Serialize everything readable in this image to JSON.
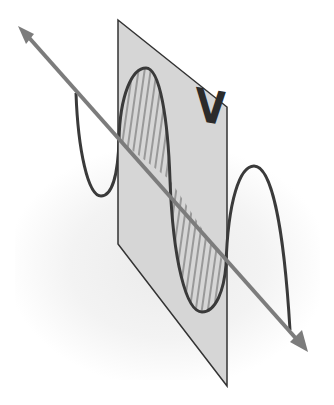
{
  "diagram": {
    "plane_label": "V",
    "colors": {
      "background": "#ffffff",
      "plane_fill": "#d6d6d6",
      "plane_stroke": "#333333",
      "wave_stroke": "#3a3a3a",
      "hatch_stroke": "#707070",
      "axis_arrow": "#7c7c7c",
      "label": "#2b2b2b"
    },
    "elements": [
      {
        "name": "propagation-axis-arrow",
        "type": "double-headed arrow",
        "from": [
          20,
          28
        ],
        "to": [
          306,
          350
        ]
      },
      {
        "name": "polarization-plane",
        "type": "parallelogram",
        "points": [
          [
            118,
            20
          ],
          [
            227,
            107
          ],
          [
            227,
            386
          ],
          [
            118,
            244
          ]
        ]
      },
      {
        "name": "sine-wave",
        "type": "sinusoid",
        "segments": [
          "left lobe (behind plane)",
          "positive lobe (hatched, in plane)",
          "negative lobe (hatched, in plane)",
          "right lobe (in front of plane)"
        ]
      },
      {
        "name": "plane-label",
        "text": "V"
      }
    ]
  }
}
